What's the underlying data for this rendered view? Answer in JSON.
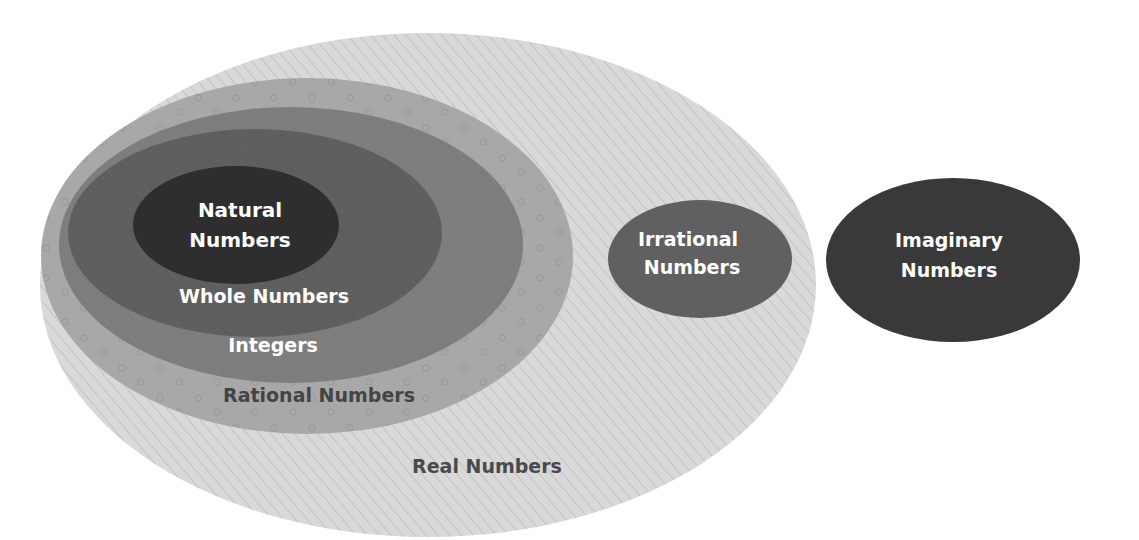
{
  "diagram": {
    "type": "nested-venn",
    "title": "",
    "sets": [
      {
        "id": "real",
        "label": "Real Numbers",
        "label_color": "#4a4a4a",
        "fill": "#d6d6d6",
        "pattern": "diagonal-lines"
      },
      {
        "id": "rational",
        "label": "Rational Numbers",
        "label_color": "#444444",
        "fill": "#a9a9a9",
        "pattern": "small-circles"
      },
      {
        "id": "integers",
        "label": "Integers",
        "label_color": "#ffffff",
        "fill": "#7e7e7e"
      },
      {
        "id": "whole",
        "label": "Whole Numbers",
        "label_color": "#ffffff",
        "fill": "#5d5d5d"
      },
      {
        "id": "natural",
        "label": [
          "Natural",
          "Numbers"
        ],
        "label_color": "#ffffff",
        "fill": "#2f2f2f"
      },
      {
        "id": "irrational",
        "label": [
          "Irrational",
          "Numbers"
        ],
        "label_color": "#ffffff",
        "fill": "#616161"
      },
      {
        "id": "imaginary",
        "label": [
          "Imaginary",
          "Numbers"
        ],
        "label_color": "#ffffff",
        "fill": "#3a3a3a"
      }
    ],
    "relations": [
      "Natural Numbers ⊂ Whole Numbers",
      "Whole Numbers ⊂ Integers",
      "Integers ⊂ Rational Numbers",
      "Rational Numbers ⊂ Real Numbers",
      "Irrational Numbers ⊂ Real Numbers",
      "Imaginary Numbers outside Real Numbers"
    ]
  },
  "labels": {
    "natural_1": "Natural",
    "natural_2": "Numbers",
    "whole": "Whole Numbers",
    "integers": "Integers",
    "rational": "Rational Numbers",
    "real": "Real Numbers",
    "irrational_1": "Irrational",
    "irrational_2": "Numbers",
    "imaginary_1": "Imaginary",
    "imaginary_2": "Numbers"
  }
}
